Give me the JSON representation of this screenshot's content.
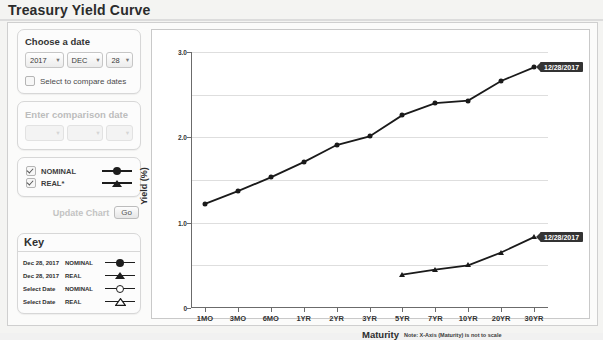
{
  "page": {
    "title": "Treasury Yield Curve"
  },
  "controls": {
    "choose_date_label": "Choose a date",
    "date": {
      "year": "2017",
      "month": "DEC",
      "day": "28"
    },
    "compare_checkbox_label": "Select to compare dates",
    "compare_checked": false,
    "comparison_label": "Enter comparison date",
    "comparison_placeholder": "-",
    "series_toggles": [
      {
        "label": "NOMINAL",
        "checked": true,
        "marker": "filled-circle"
      },
      {
        "label": "REAL*",
        "checked": true,
        "marker": "filled-triangle"
      }
    ],
    "update_label": "Update Chart",
    "go_label": "Go"
  },
  "key": {
    "header": "Key",
    "rows": [
      {
        "date": "Dec 28, 2017",
        "series": "NOMINAL",
        "marker": "filled-circle"
      },
      {
        "date": "Dec 28, 2017",
        "series": "REAL",
        "marker": "filled-triangle"
      },
      {
        "date": "Select Date",
        "series": "NOMINAL",
        "marker": "open-circle"
      },
      {
        "date": "Select Date",
        "series": "REAL",
        "marker": "open-triangle"
      }
    ]
  },
  "chart_data": {
    "type": "line",
    "title": "",
    "xlabel": "Maturity",
    "ylabel": "Yield (%)",
    "note": "Note: X-Axis (Maturity) is not to scale",
    "categories": [
      "1MO",
      "3MO",
      "6MO",
      "1YR",
      "2YR",
      "3YR",
      "5YR",
      "7YR",
      "10YR",
      "20YR",
      "30YR"
    ],
    "ylim": [
      0,
      3.0
    ],
    "yticks": [
      "0",
      "1.0",
      "2.0",
      "3.0"
    ],
    "ytick_values": [
      0,
      1.0,
      2.0,
      3.0
    ],
    "gridlines": [
      0.5,
      1.0,
      1.5,
      2.0,
      2.5,
      3.0
    ],
    "grid": true,
    "legend": "external-key-panel",
    "series": [
      {
        "name": "NOMINAL",
        "date": "12/28/2017",
        "marker": "filled-circle",
        "values": [
          1.22,
          1.37,
          1.53,
          1.71,
          1.91,
          2.01,
          2.26,
          2.4,
          2.43,
          2.66,
          2.82
        ],
        "annotation": "12/28/2017"
      },
      {
        "name": "REAL",
        "date": "12/28/2017",
        "marker": "filled-triangle",
        "start_category": "5YR",
        "values": [
          null,
          null,
          null,
          null,
          null,
          null,
          0.39,
          0.45,
          0.5,
          0.65,
          0.83
        ],
        "annotation": "12/28/2017"
      }
    ]
  },
  "colors": {
    "line": "#1a1a1a",
    "grid": "#dedede",
    "axis": "#6b6b6b",
    "tooltip_bg": "#333333"
  }
}
